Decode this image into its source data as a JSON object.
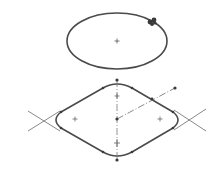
{
  "diagram": {
    "type": "cad-sketch",
    "colors": {
      "background": "#ffffff",
      "geometry": "#4a4a4a",
      "construction": "#8a8a8a",
      "point": "#3a3a3a"
    },
    "ellipse": {
      "cx": 117,
      "cy": 41,
      "rx": 50,
      "ry": 28,
      "center_marker": "plus"
    },
    "cursor": {
      "x": 152,
      "y": 21,
      "icon": "move-cursor-icon"
    },
    "rounded_diamond": {
      "center": [
        117,
        119
      ],
      "top_point": [
        117,
        80
      ],
      "bottom_point": [
        117,
        160
      ],
      "left_extent": 55,
      "right_extent": 180,
      "top_extent": 84,
      "bottom_extent": 155,
      "arc_centers": [
        [
          75,
          119
        ],
        [
          160,
          119
        ],
        [
          117,
          96
        ],
        [
          117,
          143
        ]
      ]
    },
    "construction_line": {
      "from": [
        117,
        119
      ],
      "to": [
        175,
        88
      ],
      "style": "dash-dot"
    }
  }
}
